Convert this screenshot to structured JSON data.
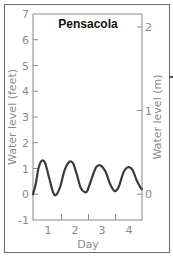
{
  "chart_data": {
    "type": "line",
    "title": "Pensacola",
    "xlabel": "Day",
    "ylabel": "Water level (feet)",
    "ylabel_right": "Water level (m)",
    "xlim": [
      0.5,
      4.5
    ],
    "ylim": [
      -1,
      7
    ],
    "ylim_right_m": [
      -0.3,
      2.13
    ],
    "x_ticks": [
      1,
      2,
      3,
      4
    ],
    "y_ticks": [
      -1,
      0,
      1,
      2,
      3,
      4,
      5,
      6,
      7
    ],
    "y_ticks_right": [
      0,
      1,
      2
    ],
    "grid": false,
    "series": [
      {
        "name": "Water level",
        "x": [
          0.5,
          0.6,
          0.7,
          0.82,
          0.95,
          1.1,
          1.25,
          1.35,
          1.5,
          1.65,
          1.82,
          1.97,
          2.1,
          2.25,
          2.4,
          2.5,
          2.65,
          2.82,
          2.98,
          3.15,
          3.35,
          3.5,
          3.65,
          3.82,
          3.98,
          4.15,
          4.3,
          4.45,
          4.5
        ],
        "values": [
          0.0,
          0.4,
          1.0,
          1.3,
          1.2,
          0.6,
          0.05,
          -0.02,
          0.3,
          0.9,
          1.25,
          1.2,
          0.8,
          0.25,
          0.08,
          0.15,
          0.6,
          1.05,
          1.12,
          0.9,
          0.35,
          0.12,
          0.3,
          0.85,
          1.05,
          0.95,
          0.55,
          0.25,
          0.2
        ]
      }
    ],
    "annotations": []
  },
  "labels": {
    "title": "Pensacola",
    "xlabel": "Day",
    "ylabel_left": "Water level (feet)",
    "ylabel_right": "Water level (m)",
    "left_ticks": [
      "7",
      "6",
      "5",
      "4",
      "3",
      "2",
      "1",
      "0",
      "-1"
    ],
    "right_ticks": [
      "2",
      "1",
      "0"
    ],
    "x_ticks": [
      "1",
      "2",
      "3",
      "4"
    ]
  },
  "colors": {
    "line": "#3a3a3a",
    "axis": "#8a8a8a",
    "frame": "#6a6a6a"
  }
}
